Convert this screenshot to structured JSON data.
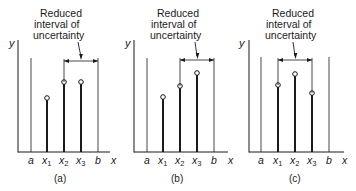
{
  "annotation": {
    "line1": "Reduced",
    "line2": "interval of",
    "line3": "uncertainty"
  },
  "axis_labels": {
    "y": "y",
    "x": "x"
  },
  "tick_labels": {
    "a": "a",
    "x1": "x",
    "x1_sub": "1",
    "x2": "x",
    "x2_sub": "2",
    "x3": "x",
    "x3_sub": "3",
    "b": "b"
  },
  "panels": [
    {
      "id": "a",
      "caption": "(a)"
    },
    {
      "id": "b",
      "caption": "(b)"
    },
    {
      "id": "c",
      "caption": "(c)"
    }
  ],
  "colors": {
    "ink": "#1a1a1a",
    "background": "#ffffff"
  }
}
